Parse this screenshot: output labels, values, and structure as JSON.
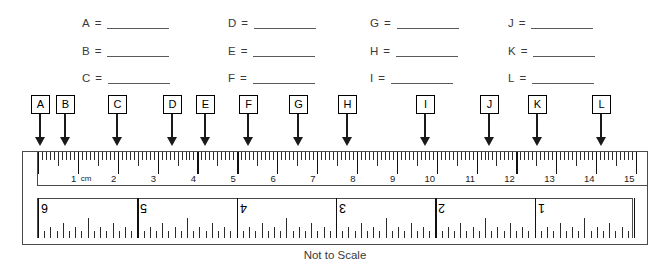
{
  "worksheet": {
    "caption": "Not to Scale",
    "equals_sign": "=",
    "answers": [
      {
        "letter": "A"
      },
      {
        "letter": "B"
      },
      {
        "letter": "C"
      },
      {
        "letter": "D"
      },
      {
        "letter": "E"
      },
      {
        "letter": "F"
      },
      {
        "letter": "G"
      },
      {
        "letter": "H"
      },
      {
        "letter": "I"
      },
      {
        "letter": "J"
      },
      {
        "letter": "K"
      },
      {
        "letter": "L"
      }
    ],
    "answer_columns": [
      {
        "letters": [
          "A",
          "B",
          "C"
        ],
        "x": 82
      },
      {
        "letters": [
          "D",
          "E",
          "F"
        ],
        "x": 228
      },
      {
        "letters": [
          "G",
          "H",
          "I"
        ],
        "x": 370
      },
      {
        "letters": [
          "J",
          "K",
          "L"
        ],
        "x": 508
      }
    ],
    "answer_rows_y": [
      18,
      46,
      73
    ],
    "blank_width": 62
  },
  "pointers": [
    {
      "label": "A",
      "box_x": 31,
      "arrow_x": 40,
      "box_y": 0,
      "stem_h": 23
    },
    {
      "label": "B",
      "box_x": 56,
      "arrow_x": 65,
      "box_y": 0,
      "stem_h": 23
    },
    {
      "label": "C",
      "box_x": 108,
      "arrow_x": 117,
      "box_y": 0,
      "stem_h": 23
    },
    {
      "label": "D",
      "box_x": 163,
      "arrow_x": 172,
      "box_y": 0,
      "stem_h": 23
    },
    {
      "label": "E",
      "box_x": 196,
      "arrow_x": 205,
      "box_y": 0,
      "stem_h": 23
    },
    {
      "label": "F",
      "box_x": 239,
      "arrow_x": 248,
      "box_y": 0,
      "stem_h": 23
    },
    {
      "label": "G",
      "box_x": 289,
      "arrow_x": 298,
      "box_y": 0,
      "stem_h": 23
    },
    {
      "label": "H",
      "box_x": 338,
      "arrow_x": 347,
      "box_y": 0,
      "stem_h": 23
    },
    {
      "label": "I",
      "box_x": 416,
      "arrow_x": 425,
      "box_y": 0,
      "stem_h": 23
    },
    {
      "label": "J",
      "box_x": 480,
      "arrow_x": 489,
      "box_y": 0,
      "stem_h": 23
    },
    {
      "label": "K",
      "box_x": 528,
      "arrow_x": 537,
      "box_y": 0,
      "stem_h": 23
    },
    {
      "label": "L",
      "box_x": 592,
      "arrow_x": 601,
      "box_y": 0,
      "stem_h": 23
    }
  ],
  "ruler": {
    "metric": {
      "unit_label": "cm",
      "unit_label_after": 1,
      "min": 0,
      "max": 15,
      "numbers": [
        1,
        2,
        3,
        4,
        5,
        6,
        7,
        8,
        9,
        10,
        11,
        12,
        13,
        14,
        15
      ],
      "subdivisions_per_unit": 10,
      "orientation": "ticks-from-top"
    },
    "imperial": {
      "min": 1,
      "max": 6,
      "numbers": [
        6,
        5,
        4,
        3,
        2,
        1
      ],
      "subdivisions_per_unit": 16,
      "orientation": "inverted-ticks-from-bottom",
      "rotated_digits": true
    }
  }
}
